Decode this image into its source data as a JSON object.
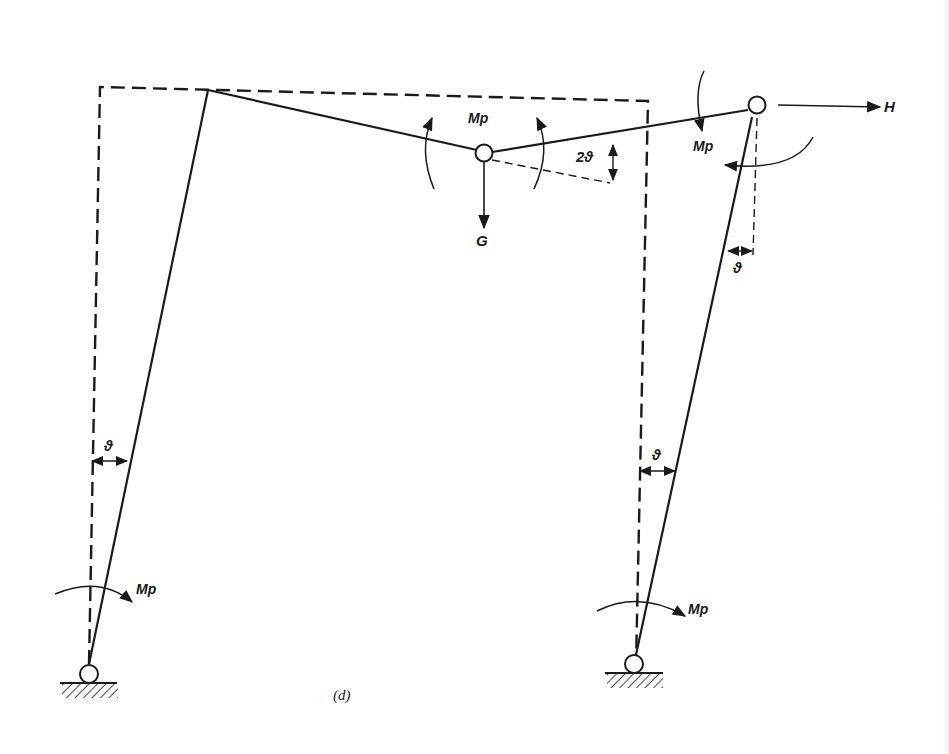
{
  "figure": {
    "caption": "(d)"
  },
  "labels": {
    "moment_mid": "Mp",
    "moment_right_joint": "Mp",
    "moment_left_base": "Mp",
    "moment_right_base": "Mp",
    "angle_mid": "2ϑ",
    "angle_right_top": "ϑ",
    "angle_left_col": "ϑ",
    "angle_right_col": "ϑ",
    "load_vertical": "G",
    "load_horizontal": "H"
  },
  "colors": {
    "line": "#1a1a1a",
    "background": "#ffffff"
  }
}
